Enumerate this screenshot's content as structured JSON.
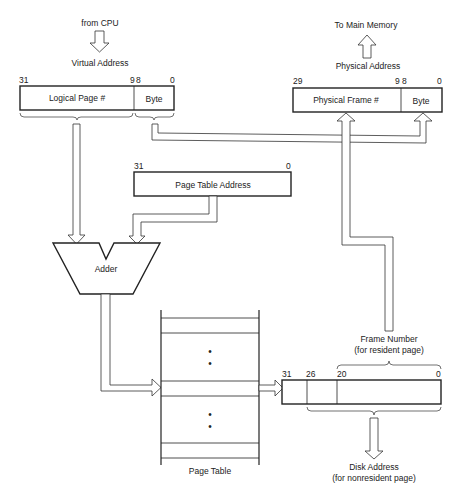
{
  "diagram": {
    "virtual_address": {
      "source_label": "from CPU",
      "label": "Virtual Address",
      "bit_high": "31",
      "bit_split_hi": "9",
      "bit_split_lo": "8",
      "bit_low": "0",
      "fields": [
        "Logical Page #",
        "Byte"
      ]
    },
    "physical_address": {
      "dest_label": "To Main Memory",
      "label": "Physical Address",
      "bit_high": "29",
      "bit_split_hi": "9",
      "bit_split_lo": "8",
      "bit_low": "0",
      "fields": [
        "Physical Frame #",
        "Byte"
      ]
    },
    "page_table_address": {
      "label": "Page Table Address",
      "bit_high": "31",
      "bit_low": "0"
    },
    "adder": {
      "label": "Adder"
    },
    "page_table": {
      "label": "Page Table",
      "ellipsis": "•"
    },
    "page_table_entry": {
      "bit_31": "31",
      "bit_26": "26",
      "bit_20": "20",
      "bit_0": "0",
      "frame_number_label": "Frame Number",
      "frame_number_note": "(for resident page)",
      "disk_address_label": "Disk Address",
      "disk_address_note": "(for nonresident page)"
    }
  }
}
